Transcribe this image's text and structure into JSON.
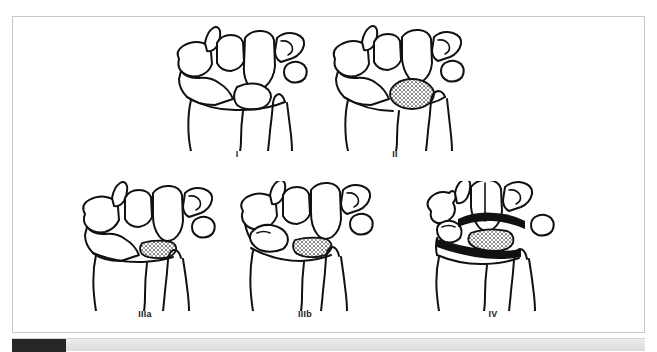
{
  "figure": {
    "kind": "medical-line-drawing",
    "panels": [
      {
        "id": "panel-1",
        "label": "I",
        "row": "top",
        "stippling": "none",
        "description": "Normal wrist carpal bone outlines, no sclerotic lunate shading"
      },
      {
        "id": "panel-2",
        "label": "II",
        "row": "top",
        "stippling": "lunate-dense-oval",
        "description": "Lunate shown as a densely stippled oval, normal height"
      },
      {
        "id": "panel-3",
        "label": "IIIa",
        "row": "bottom",
        "stippling": "lunate-collapsed-block",
        "description": "Collapsed stippled lunate, scaphoid alignment preserved"
      },
      {
        "id": "panel-4",
        "label": "IIIb",
        "row": "bottom",
        "stippling": "lunate-collapsed-block",
        "description": "Collapsed stippled lunate with scaphoid rotation / flexion"
      },
      {
        "id": "panel-5",
        "label": "IV",
        "row": "bottom",
        "stippling": "generalized-degenerative",
        "description": "Collapsed lunate plus widespread stippled degenerative change of the radiocarpal and midcarpal joints"
      }
    ]
  },
  "scrollbar": {
    "orientation": "horizontal",
    "thumb_label": "",
    "thumb_color": "#262626",
    "track_color": "#e4e4e4"
  },
  "colors": {
    "page_background": "#ffffff",
    "frame_border": "#c8c8c8",
    "ink": "#111111",
    "label_text": "#1a1a1a"
  }
}
